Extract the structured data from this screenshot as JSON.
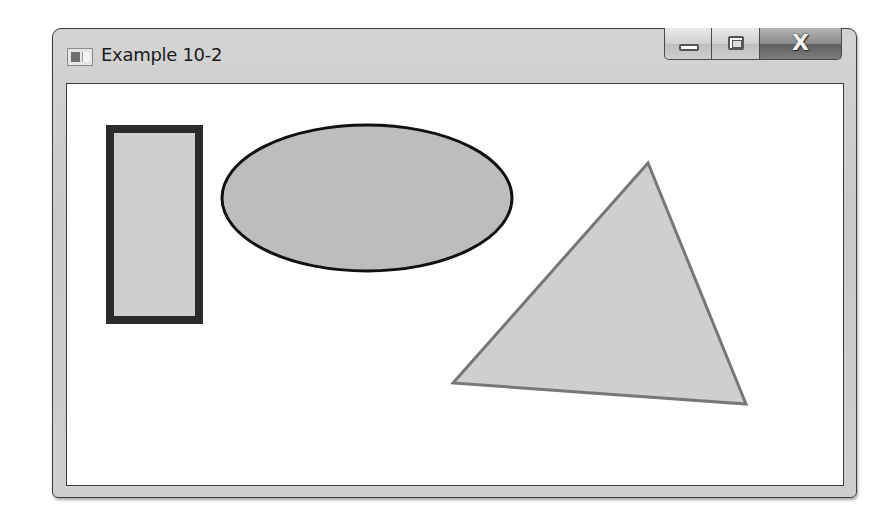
{
  "window": {
    "title": "Example 10-2",
    "controls": {
      "minimize_label": "Minimize",
      "maximize_label": "Maximize",
      "close_label": "X"
    }
  },
  "canvas": {
    "shapes": [
      {
        "type": "rectangle",
        "x": 105,
        "y": 124,
        "width": 97,
        "height": 199,
        "fill": "#cfcfcf",
        "stroke": "#2b2b2b",
        "stroke_width": 8
      },
      {
        "type": "ellipse",
        "cx": 366,
        "cy": 197,
        "rx": 145,
        "ry": 73,
        "fill": "#bdbdbd",
        "stroke": "#111111",
        "stroke_width": 3
      },
      {
        "type": "polygon",
        "points": [
          [
            647,
            162
          ],
          [
            452,
            382
          ],
          [
            745,
            403
          ]
        ],
        "fill": "#cfcfcf",
        "stroke": "#777777",
        "stroke_width": 3
      }
    ]
  }
}
